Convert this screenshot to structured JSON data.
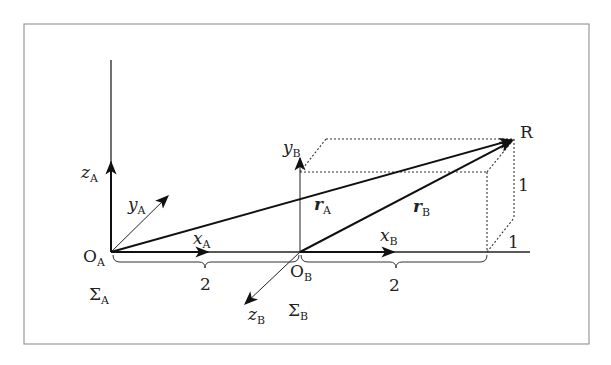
{
  "figure": {
    "frame": {
      "x": 24,
      "y": 24,
      "width": 565,
      "height": 320,
      "border_color": "#9a9a9a"
    },
    "labels": {
      "origin_A": {
        "main": "O",
        "sub": "A"
      },
      "origin_B": {
        "main": "O",
        "sub": "B"
      },
      "frame_A": {
        "main": "Σ",
        "sub": "A"
      },
      "frame_B": {
        "main": "Σ",
        "sub": "B"
      },
      "x_A": {
        "main": "x",
        "sub": "A"
      },
      "y_A": {
        "main": "y",
        "sub": "A"
      },
      "z_A": {
        "main": "z",
        "sub": "A"
      },
      "x_B": {
        "main": "x",
        "sub": "B"
      },
      "y_B": {
        "main": "y",
        "sub": "B"
      },
      "z_B": {
        "main": "z",
        "sub": "B"
      },
      "r_A": {
        "main": "r",
        "sub": "A"
      },
      "r_B": {
        "main": "r",
        "sub": "B"
      },
      "point_R": "R",
      "dist_OA_OB": "2",
      "dist_OB_box": "2",
      "box_height": "1",
      "box_depth": "1"
    },
    "points": {
      "O_A": [
        111,
        252
      ],
      "O_B": [
        300,
        252
      ],
      "R": [
        514,
        139
      ]
    }
  }
}
